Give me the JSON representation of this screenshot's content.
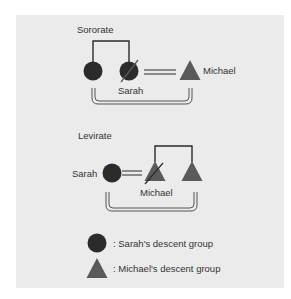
{
  "colors": {
    "panel_bg": "#ebebeb",
    "circle_fill": "#2b2b2b",
    "triangle_fill": "#5a5a5a",
    "line": "#2b2b2b",
    "text": "#333333"
  },
  "sororate": {
    "title": "Sororate",
    "nodes": [
      {
        "shape": "circle",
        "label": "",
        "deceased": false
      },
      {
        "shape": "circle",
        "label": "Sarah",
        "deceased": true
      },
      {
        "shape": "triangle",
        "label": "Michael",
        "deceased": false
      }
    ],
    "marriage": "Sarah = Michael",
    "siblings": "two circles share a parent bracket"
  },
  "levirate": {
    "title": "Levirate",
    "nodes": [
      {
        "shape": "circle",
        "label": "Sarah",
        "deceased": false
      },
      {
        "shape": "triangle",
        "label": "Michael",
        "deceased": true
      },
      {
        "shape": "triangle",
        "label": "",
        "deceased": false
      }
    ],
    "marriage": "Sarah = Michael",
    "siblings": "two triangles share a parent bracket"
  },
  "legend": {
    "items": [
      {
        "shape": "circle",
        "text": ": Sarah's descent group"
      },
      {
        "shape": "triangle",
        "text": ": Michael's descent group"
      }
    ]
  }
}
